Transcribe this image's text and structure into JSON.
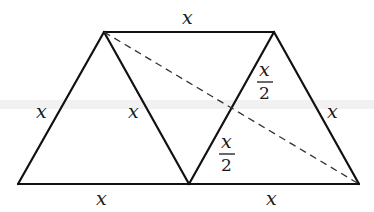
{
  "figure": {
    "colors": {
      "line": "#111111",
      "dashed": "#333333",
      "text": "#1a1a1a",
      "background": "#ffffff"
    },
    "vertices": {
      "top_left": [
        104,
        32
      ],
      "top_right": [
        274,
        32
      ],
      "bottom_left": [
        18,
        184
      ],
      "bottom_middle": [
        189,
        184
      ],
      "bottom_right": [
        359,
        184
      ]
    },
    "labels": {
      "top": "x",
      "left": "x",
      "inner_left": "x",
      "right": "x",
      "bottom_left": "x",
      "bottom_right": "x",
      "upper_half": {
        "numerator": "x",
        "denominator": "2"
      },
      "lower_half": {
        "numerator": "x",
        "denominator": "2"
      }
    }
  }
}
